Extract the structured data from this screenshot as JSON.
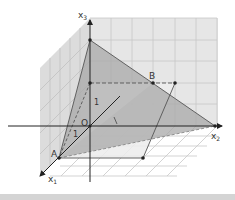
{
  "diagram": {
    "type": "3d-coordinate-system",
    "axes": [
      {
        "name": "x1",
        "label_main": "x",
        "label_sub": "1"
      },
      {
        "name": "x2",
        "label_main": "x",
        "label_sub": "2"
      },
      {
        "name": "x3",
        "label_main": "x",
        "label_sub": "3"
      }
    ],
    "points": [
      {
        "name": "A",
        "label": "A"
      },
      {
        "name": "B",
        "label": "B"
      },
      {
        "name": "O",
        "label": "O"
      }
    ],
    "unit_labels": {
      "x3_unit": "1",
      "x2_unit": "1",
      "x1_unit": "1"
    },
    "colors": {
      "grid": "#c8c8c8",
      "plane_back": "#e2e2e2",
      "plane_side": "#d6d6d6",
      "triangle_dark": "#9a9a9a",
      "triangle_light": "#c4c4c4",
      "parallelogram": "#e6e6e6",
      "axis": "#333333"
    }
  }
}
